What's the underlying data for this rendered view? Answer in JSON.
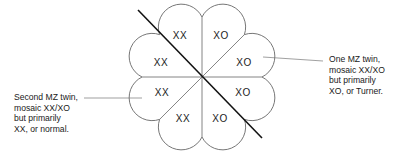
{
  "diagram": {
    "type": "mosaic-twin-embryo",
    "center": {
      "x": 202,
      "y": 77
    },
    "sectors": [
      {
        "position": "top-left",
        "label": "XX"
      },
      {
        "position": "top-right",
        "label": "XO"
      },
      {
        "position": "right-upper",
        "label": "XO"
      },
      {
        "position": "right-lower",
        "label": "XO"
      },
      {
        "position": "bottom-right",
        "label": "XO"
      },
      {
        "position": "bottom-left",
        "label": "XX"
      },
      {
        "position": "left-lower",
        "label": "XX"
      },
      {
        "position": "left-upper",
        "label": "XX"
      }
    ],
    "callouts": {
      "right": {
        "lines": [
          "One MZ twin,",
          "mosaic XX/XO",
          "but primarily",
          "XO, or Turner."
        ]
      },
      "left": {
        "lines": [
          "Second MZ twin,",
          "mosaic XX/XO",
          "but primarily",
          "XX, or normal."
        ]
      }
    },
    "colors": {
      "outline": "#555555",
      "divider": "#111111",
      "text": "#1a1a1a"
    }
  }
}
